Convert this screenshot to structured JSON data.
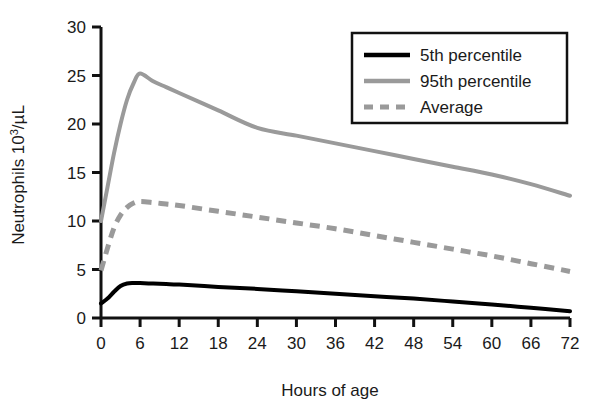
{
  "chart_data": {
    "type": "line",
    "title": "",
    "xlabel": "Hours of age",
    "ylabel": "Neutrophils 10^3/µL",
    "ylabel_main": "Neutrophils 10",
    "ylabel_sup": "3",
    "ylabel_tail": "/µL",
    "xlim": [
      0,
      72
    ],
    "ylim": [
      0,
      30
    ],
    "xticks": [
      0,
      6,
      12,
      18,
      24,
      30,
      36,
      42,
      48,
      54,
      60,
      66,
      72
    ],
    "yticks": [
      0,
      5,
      10,
      15,
      20,
      25,
      30
    ],
    "xtick_labels": [
      "0",
      "6",
      "12",
      "18",
      "24",
      "30",
      "36",
      "42",
      "48",
      "54",
      "60",
      "66",
      "72"
    ],
    "ytick_labels": [
      "0",
      "5",
      "10",
      "15",
      "20",
      "25",
      "30"
    ],
    "grid": false,
    "legend_position": "top-right",
    "series": [
      {
        "name": "5th percentile",
        "color": "#000000",
        "style": "solid",
        "width": 4,
        "x": [
          0,
          1,
          2,
          3,
          4,
          5,
          6,
          8,
          10,
          12,
          18,
          24,
          30,
          36,
          42,
          48,
          54,
          60,
          66,
          72
        ],
        "values": [
          1.5,
          2.0,
          2.7,
          3.3,
          3.55,
          3.6,
          3.6,
          3.55,
          3.5,
          3.45,
          3.2,
          3.0,
          2.75,
          2.5,
          2.25,
          2.0,
          1.7,
          1.4,
          1.05,
          0.7
        ]
      },
      {
        "name": "95th percentile",
        "color": "#9a9a9a",
        "style": "solid",
        "width": 4,
        "x": [
          0,
          1,
          2,
          3,
          4,
          5,
          6,
          8,
          10,
          12,
          18,
          24,
          30,
          36,
          42,
          48,
          54,
          60,
          66,
          72
        ],
        "values": [
          10.0,
          13.5,
          17.0,
          20.0,
          22.5,
          24.2,
          25.2,
          24.4,
          23.8,
          23.2,
          21.4,
          19.6,
          18.8,
          18.0,
          17.2,
          16.4,
          15.6,
          14.8,
          13.8,
          12.6
        ]
      },
      {
        "name": "Average",
        "color": "#9a9a9a",
        "style": "dashed",
        "width": 5,
        "x": [
          0,
          1,
          2,
          3,
          4,
          5,
          6,
          8,
          10,
          12,
          18,
          24,
          30,
          36,
          42,
          48,
          54,
          60,
          66,
          72
        ],
        "values": [
          4.9,
          7.2,
          9.3,
          10.6,
          11.4,
          11.85,
          12.0,
          11.9,
          11.75,
          11.6,
          11.0,
          10.4,
          9.8,
          9.2,
          8.5,
          7.8,
          7.1,
          6.4,
          5.6,
          4.8
        ]
      }
    ],
    "legend": [
      {
        "label": "5th percentile",
        "color": "#000000",
        "style": "solid"
      },
      {
        "label": "95th percentile",
        "color": "#9a9a9a",
        "style": "solid"
      },
      {
        "label": "Average",
        "color": "#9a9a9a",
        "style": "dashed"
      }
    ]
  },
  "axis": {
    "color": "#111111"
  }
}
